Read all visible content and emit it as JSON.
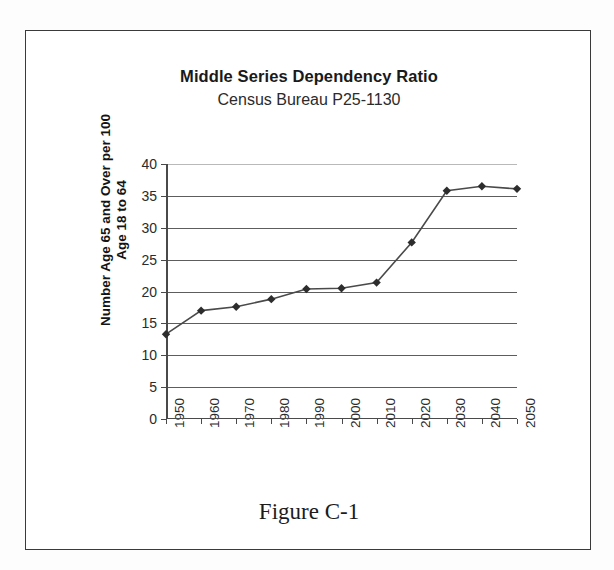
{
  "figure": {
    "caption": "Figure C-1",
    "border_color": "#3a3a3a"
  },
  "chart_data": {
    "type": "line",
    "title": "Middle Series Dependency Ratio",
    "subtitle": "Census Bureau P25-1130",
    "xlabel": "",
    "ylabel": "Number Age 65 and Over per 100 Age 18 to 64",
    "ylabel_line1": "Number Age 65 and Over per 100",
    "ylabel_line2": "Age 18 to 64",
    "categories": [
      "1950",
      "1960",
      "1970",
      "1980",
      "1990",
      "2000",
      "2010",
      "2020",
      "2030",
      "2040",
      "2050"
    ],
    "values": [
      13.3,
      17.0,
      17.6,
      18.8,
      20.4,
      20.5,
      21.4,
      27.7,
      35.8,
      36.5,
      36.1
    ],
    "ylim": [
      0,
      40
    ],
    "yticks": [
      0,
      5,
      10,
      15,
      20,
      25,
      30,
      35,
      40
    ],
    "ytick_labels": [
      "0",
      "5",
      "10",
      "15",
      "20",
      "25",
      "30",
      "35",
      "40"
    ],
    "grid": true,
    "grid_axis": "y",
    "legend": false,
    "legend_position": "none",
    "series": [
      {
        "name": "Middle Series",
        "values": [
          13.3,
          17.0,
          17.6,
          18.8,
          20.4,
          20.5,
          21.4,
          27.7,
          35.8,
          36.5,
          36.1
        ],
        "line_color": "#4a4a4a",
        "marker": "diamond",
        "marker_color": "#2d2d2d"
      }
    ]
  }
}
